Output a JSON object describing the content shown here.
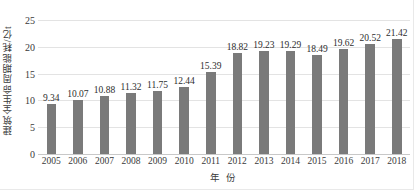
{
  "chart_data": {
    "type": "bar",
    "title": "",
    "xlabel": "年 份",
    "ylabel": "建筑全生命周期能耗/亿t",
    "categories": [
      "2005",
      "2006",
      "2007",
      "2008",
      "2009",
      "2010",
      "2011",
      "2012",
      "2013",
      "2014",
      "2015",
      "2016",
      "2017",
      "2018"
    ],
    "values": [
      9.34,
      10.07,
      10.88,
      11.32,
      11.75,
      12.44,
      15.39,
      18.82,
      19.23,
      19.29,
      18.49,
      19.62,
      20.52,
      21.42
    ],
    "value_labels": [
      "9.34",
      "10.07",
      "10.88",
      "11.32",
      "11.75",
      "12.44",
      "15.39",
      "18.82",
      "19.23",
      "19.29",
      "18.49",
      "19.62",
      "20.52",
      "21.42"
    ],
    "ylim": [
      0,
      25
    ],
    "yticks": [
      0,
      5,
      10,
      15,
      20,
      25
    ],
    "ytick_labels": [
      "0",
      "5",
      "10",
      "15",
      "20",
      "25"
    ],
    "grid": true,
    "legend": false,
    "bar_color": "#7a7a7a",
    "gridline_color": "#e3e3e3",
    "text_color": "#3a3a3a",
    "show_value_labels": true
  }
}
